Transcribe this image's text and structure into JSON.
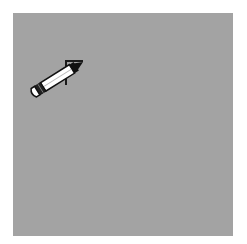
{
  "canvas": {
    "background_color": "#a3a3a3",
    "page_color": "#ffffff"
  },
  "stroke": {
    "color": "#1a1a1a",
    "points": [
      [
        66,
        85
      ],
      [
        66,
        61
      ],
      [
        83,
        61
      ]
    ]
  },
  "cursor": {
    "icon": "pencil-icon",
    "tip": [
      83,
      62
    ],
    "angle_deg": 60
  }
}
